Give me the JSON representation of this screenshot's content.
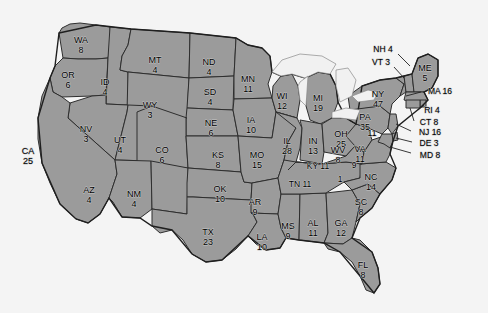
{
  "map": {
    "title": "United States Electoral Vote Map",
    "colors": {
      "state_fill": "#9b9b9b",
      "state_border": "#2e2e2e",
      "background": "#f4f4f4",
      "lake_fill": "#f1f1f1",
      "label_text": "#000000"
    },
    "states": [
      {
        "abbr": "WA",
        "votes": "8",
        "x": 81,
        "y": 41,
        "layout": "stacked"
      },
      {
        "abbr": "OR",
        "votes": "6",
        "x": 68,
        "y": 76,
        "layout": "stacked"
      },
      {
        "abbr": "ID",
        "votes": "4",
        "x": 105,
        "y": 83,
        "layout": "stacked"
      },
      {
        "abbr": "MT",
        "votes": "4",
        "x": 155,
        "y": 61,
        "layout": "stacked"
      },
      {
        "abbr": "ND",
        "votes": "4",
        "x": 209,
        "y": 63,
        "layout": "stacked"
      },
      {
        "abbr": "SD",
        "votes": "4",
        "x": 210,
        "y": 93,
        "layout": "stacked"
      },
      {
        "abbr": "WY",
        "votes": "3",
        "x": 150,
        "y": 106,
        "layout": "stacked"
      },
      {
        "abbr": "NE",
        "votes": "6",
        "x": 211,
        "y": 124,
        "layout": "stacked"
      },
      {
        "abbr": "MN",
        "votes": "11",
        "x": 248,
        "y": 80,
        "layout": "stacked"
      },
      {
        "abbr": "WI",
        "votes": "12",
        "x": 282,
        "y": 97,
        "layout": "stacked"
      },
      {
        "abbr": "MI",
        "votes": "19",
        "x": 318,
        "y": 99,
        "layout": "stacked"
      },
      {
        "abbr": "IA",
        "votes": "10",
        "x": 251,
        "y": 121,
        "layout": "stacked"
      },
      {
        "abbr": "NV",
        "votes": "3",
        "x": 86,
        "y": 130,
        "layout": "stacked"
      },
      {
        "abbr": "UT",
        "votes": "4",
        "x": 120,
        "y": 141,
        "layout": "stacked"
      },
      {
        "abbr": "CO",
        "votes": "6",
        "x": 162,
        "y": 151,
        "layout": "stacked"
      },
      {
        "abbr": "CA",
        "votes": "25",
        "x": 28,
        "y": 152,
        "layout": "stacked"
      },
      {
        "abbr": "KS",
        "votes": "8",
        "x": 218,
        "y": 156,
        "layout": "stacked"
      },
      {
        "abbr": "MO",
        "votes": "15",
        "x": 257,
        "y": 156,
        "layout": "stacked"
      },
      {
        "abbr": "IL",
        "votes": "28",
        "x": 287,
        "y": 142,
        "layout": "stacked"
      },
      {
        "abbr": "IN",
        "votes": "13",
        "x": 313,
        "y": 142,
        "layout": "stacked"
      },
      {
        "abbr": "OH",
        "votes": "25",
        "x": 341,
        "y": 135,
        "layout": "stacked"
      },
      {
        "abbr": "AZ",
        "votes": "4",
        "x": 89,
        "y": 191,
        "layout": "stacked"
      },
      {
        "abbr": "NM",
        "votes": "4",
        "x": 134,
        "y": 195,
        "layout": "stacked"
      },
      {
        "abbr": "OK",
        "votes": "10",
        "x": 220,
        "y": 190,
        "layout": "stacked"
      },
      {
        "abbr": "AR",
        "votes": "9",
        "x": 255,
        "y": 203,
        "layout": "stacked"
      },
      {
        "abbr": "TX",
        "votes": "23",
        "x": 208,
        "y": 233,
        "layout": "stacked"
      },
      {
        "abbr": "LA",
        "votes": "10",
        "x": 262,
        "y": 238,
        "layout": "stacked"
      },
      {
        "abbr": "MS",
        "votes": "9",
        "x": 288,
        "y": 227,
        "layout": "stacked"
      },
      {
        "abbr": "AL",
        "votes": "11",
        "x": 313,
        "y": 224,
        "layout": "stacked"
      },
      {
        "abbr": "GA",
        "votes": "12",
        "x": 341,
        "y": 224,
        "layout": "stacked"
      },
      {
        "abbr": "FL",
        "votes": "8",
        "x": 363,
        "y": 266,
        "layout": "stacked"
      },
      {
        "abbr": "SC",
        "votes": "8",
        "x": 361,
        "y": 203,
        "layout": "stacked"
      },
      {
        "abbr": "NC",
        "votes": "14",
        "x": 371,
        "y": 178,
        "layout": "stacked"
      },
      {
        "abbr": "VA",
        "votes": "11",
        "x": 360,
        "y": 150,
        "layout": "stacked"
      },
      {
        "abbr": "WV",
        "votes": "8",
        "x": 338,
        "y": 151,
        "layout": "stacked"
      },
      {
        "abbr": "PA",
        "votes": "35",
        "x": 365,
        "y": 118,
        "layout": "stacked"
      },
      {
        "abbr": "NY",
        "votes": "47",
        "x": 378,
        "y": 95,
        "layout": "stacked"
      },
      {
        "abbr": "ME",
        "votes": "5",
        "x": 425,
        "y": 69,
        "layout": "stacked"
      }
    ],
    "callout_labels": [
      {
        "abbr": "NH",
        "votes": "4",
        "text": "NH 4",
        "x": 383,
        "y": 50,
        "leader": "M 398 54 L 410 66"
      },
      {
        "abbr": "VT",
        "votes": "3",
        "text": "VT 3",
        "x": 381,
        "y": 63,
        "leader": "M 394 67 L 404 78"
      },
      {
        "abbr": "MA",
        "votes": "16",
        "text": "MA 16",
        "x": 440,
        "y": 92,
        "leader": "M 422 94 L 408 98"
      },
      {
        "abbr": "RI",
        "votes": "4",
        "text": "RI 4",
        "x": 432,
        "y": 111,
        "leader": "M 419 112 L 406 107"
      },
      {
        "abbr": "CT",
        "votes": "8",
        "text": "CT 8",
        "x": 429,
        "y": 123,
        "leader": "M 414 123 L 400 114"
      },
      {
        "abbr": "NJ",
        "votes": "16",
        "text": "NJ 16",
        "x": 430,
        "y": 133,
        "leader": "M 412 133 L 394 125"
      },
      {
        "abbr": "DE",
        "votes": "3",
        "text": "DE 3",
        "x": 429,
        "y": 144,
        "leader": "M 413 144 L 394 138"
      },
      {
        "abbr": "MD",
        "votes": "8",
        "text": "MD 8",
        "x": 430,
        "y": 156,
        "leader": "M 412 155 L 390 147"
      },
      {
        "abbr": "KY",
        "votes": "11",
        "text": "KY 11",
        "x": 318,
        "y": 167,
        "leader": ""
      },
      {
        "abbr": "TN",
        "votes": "11",
        "text": "TN 11",
        "x": 300,
        "y": 185,
        "leader": ""
      }
    ],
    "small_markers": [
      {
        "text": "11",
        "x": 372,
        "y": 134
      },
      {
        "text": "1",
        "x": 340,
        "y": 180
      },
      {
        "text": "9",
        "x": 354,
        "y": 166
      }
    ]
  }
}
